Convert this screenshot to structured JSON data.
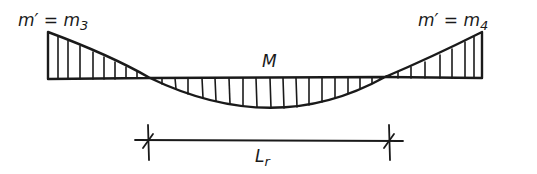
{
  "diagram": {
    "type": "bending-moment-diagram",
    "labels": {
      "left_moment": {
        "base": "m′ = m",
        "sub": "3"
      },
      "right_moment": {
        "base": "m′ = m",
        "sub": "4"
      },
      "span_moment": "M",
      "span_length": {
        "base": "L",
        "sub": "r"
      }
    },
    "colors": {
      "ink": "#1a1a1a",
      "background": "#ffffff"
    }
  }
}
